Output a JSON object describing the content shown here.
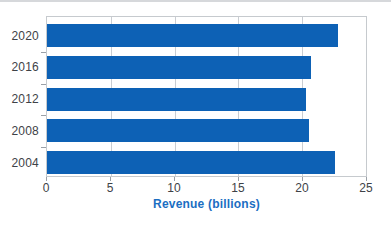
{
  "chart_data": {
    "type": "bar",
    "orientation": "horizontal",
    "title": "",
    "categories": [
      "2020",
      "2016",
      "2012",
      "2008",
      "2004"
    ],
    "values": [
      22.8,
      20.7,
      20.3,
      20.5,
      22.6
    ],
    "xlabel": "Revenue (billions)",
    "ylabel": "",
    "xlim": [
      0,
      25
    ],
    "xticks": [
      0,
      5,
      10,
      15,
      20,
      25
    ],
    "xtick_labels": [
      "0",
      "5",
      "10",
      "15",
      "20",
      "25"
    ],
    "grid": true,
    "legend": "none",
    "colors": {
      "bar": "#0d61b5",
      "xlabel_text": "#1b6ec2",
      "gridline": "#c9cdd2",
      "plot_border": "#c6cace",
      "tick_mark": "#9aa0a7",
      "axis_text": "#3e4247",
      "top_rule": "#d6d8db"
    }
  }
}
